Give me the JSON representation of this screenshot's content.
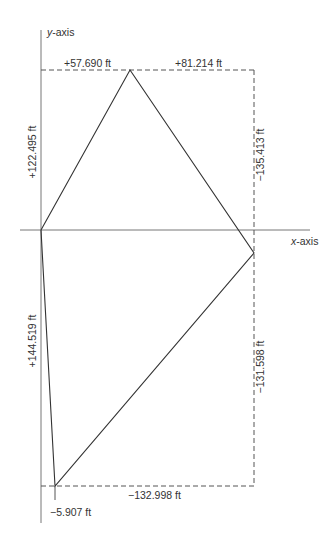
{
  "axes": {
    "x_label": "x-axis",
    "y_label": "y-axis",
    "x_label_italic": "x",
    "y_label_italic": "y",
    "suffix": "-axis"
  },
  "dimensions": {
    "top_left": "+57.690 ft",
    "top_right": "+81.214 ft",
    "left_upper": "+122.495 ft",
    "right_upper": "−135.413 ft",
    "left_lower": "+144.519 ft",
    "right_lower": "−131.598 ft",
    "bottom": "−132.998 ft",
    "bottom_offset": "−5.907 ft"
  },
  "colors": {
    "line": "#333333",
    "axis": "#666666",
    "dash": "#555555"
  }
}
